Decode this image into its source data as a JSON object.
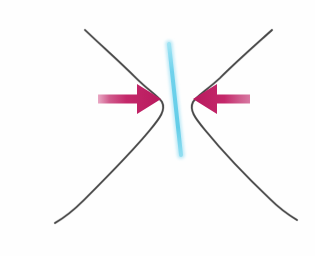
{
  "figure": {
    "background_color": "#fefefe",
    "width": 315,
    "height": 256,
    "caption": ""
  },
  "colors": {
    "curve_stroke": "#4a4a4a",
    "curve_stroke_light": "#6b6b6b",
    "arrow_body": "#c4286a",
    "arrow_head": "#b81a5e",
    "arrow_tail_fade": "#e9a8c4",
    "cyan_line": "#7fd8ee",
    "cyan_line_core": "#63cde8",
    "tick_top": "#e6bcd2",
    "tick_bottom": "#b0507f"
  },
  "shapes": {
    "left_curve": {
      "name": "left-boundary-curve",
      "path": "M 85,30 C 104,48 120,62 136,78 C 148,90 158,96 162,102 C 166,110 160,118 150,130 C 132,152 104,180 84,200 C 72,212 62,219 55,223",
      "stroke_width": 1.7
    },
    "right_curve": {
      "name": "right-boundary-curve",
      "path": "M 272,30 C 252,48 236,62 220,78 C 207,90 197,96 193,102 C 189,110 195,118 205,130 C 223,152 250,180 270,199 C 282,211 292,217 297,220",
      "stroke_width": 1.7
    },
    "cyan_line": {
      "name": "cyan-diagonal-line",
      "x1": 169,
      "y1": 44,
      "x2": 181,
      "y2": 155,
      "width": 4.0
    },
    "tick_mark": {
      "name": "magenta-tick-mark",
      "x1": 177,
      "y1": 193,
      "x2": 177,
      "y2": 226,
      "width": 3.2
    }
  },
  "arrows": {
    "left": {
      "name": "left-inward-arrow",
      "direction": "right",
      "tail_x": 98,
      "head_x": 161,
      "y": 99,
      "shaft_height": 9,
      "head_width": 24,
      "head_height": 30,
      "label": ""
    },
    "right": {
      "name": "right-inward-arrow",
      "direction": "left",
      "tail_x": 250,
      "head_x": 193,
      "y": 99,
      "shaft_height": 9,
      "head_width": 24,
      "head_height": 30,
      "label": ""
    }
  }
}
